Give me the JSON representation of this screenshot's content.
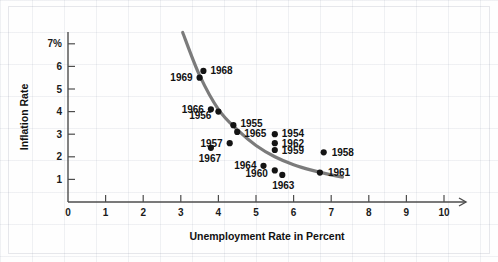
{
  "chart_data": {
    "type": "scatter",
    "title": "",
    "xlabel": "Unemployment Rate in Percent",
    "ylabel": "Inflation Rate",
    "xlim": [
      0,
      11
    ],
    "ylim": [
      0,
      7.6
    ],
    "grid": false,
    "legend": "none",
    "x_ticks": [
      "0",
      "1",
      "2",
      "3",
      "4",
      "5",
      "6",
      "7",
      "8",
      "9",
      "10"
    ],
    "y_ticks": [
      "1",
      "2",
      "3",
      "4",
      "5",
      "6",
      "7%"
    ],
    "series": [
      {
        "name": "Phillips Curve observations",
        "point_color": "#141414",
        "points": [
          {
            "label": "1968",
            "x": 3.6,
            "y": 5.8
          },
          {
            "label": "1969",
            "x": 3.5,
            "y": 5.5
          },
          {
            "label": "1966",
            "x": 3.8,
            "y": 4.1
          },
          {
            "label": "1956",
            "x": 4.0,
            "y": 4.0
          },
          {
            "label": "1955",
            "x": 4.4,
            "y": 3.4
          },
          {
            "label": "1965",
            "x": 4.5,
            "y": 3.1
          },
          {
            "label": "1957",
            "x": 4.3,
            "y": 2.6
          },
          {
            "label": "1967",
            "x": 3.8,
            "y": 2.4
          },
          {
            "label": "1954",
            "x": 5.5,
            "y": 3.0
          },
          {
            "label": "1962",
            "x": 5.5,
            "y": 2.6
          },
          {
            "label": "1959",
            "x": 5.5,
            "y": 2.3
          },
          {
            "label": "1958",
            "x": 6.8,
            "y": 2.2
          },
          {
            "label": "1964",
            "x": 5.2,
            "y": 1.6
          },
          {
            "label": "1960",
            "x": 5.5,
            "y": 1.4
          },
          {
            "label": "1963",
            "x": 5.7,
            "y": 1.2
          },
          {
            "label": "1961",
            "x": 6.7,
            "y": 1.3
          }
        ]
      }
    ],
    "fitted_curve": {
      "name": "phillips-curve-fit",
      "color": "#7b7b7b",
      "points": [
        {
          "x": 3.05,
          "y": 7.5
        },
        {
          "x": 3.5,
          "y": 5.6
        },
        {
          "x": 4.0,
          "y": 4.1
        },
        {
          "x": 4.5,
          "y": 3.2
        },
        {
          "x": 5.0,
          "y": 2.5
        },
        {
          "x": 5.5,
          "y": 2.0
        },
        {
          "x": 6.0,
          "y": 1.65
        },
        {
          "x": 6.5,
          "y": 1.4
        },
        {
          "x": 7.0,
          "y": 1.2
        },
        {
          "x": 7.3,
          "y": 1.1
        }
      ]
    }
  }
}
